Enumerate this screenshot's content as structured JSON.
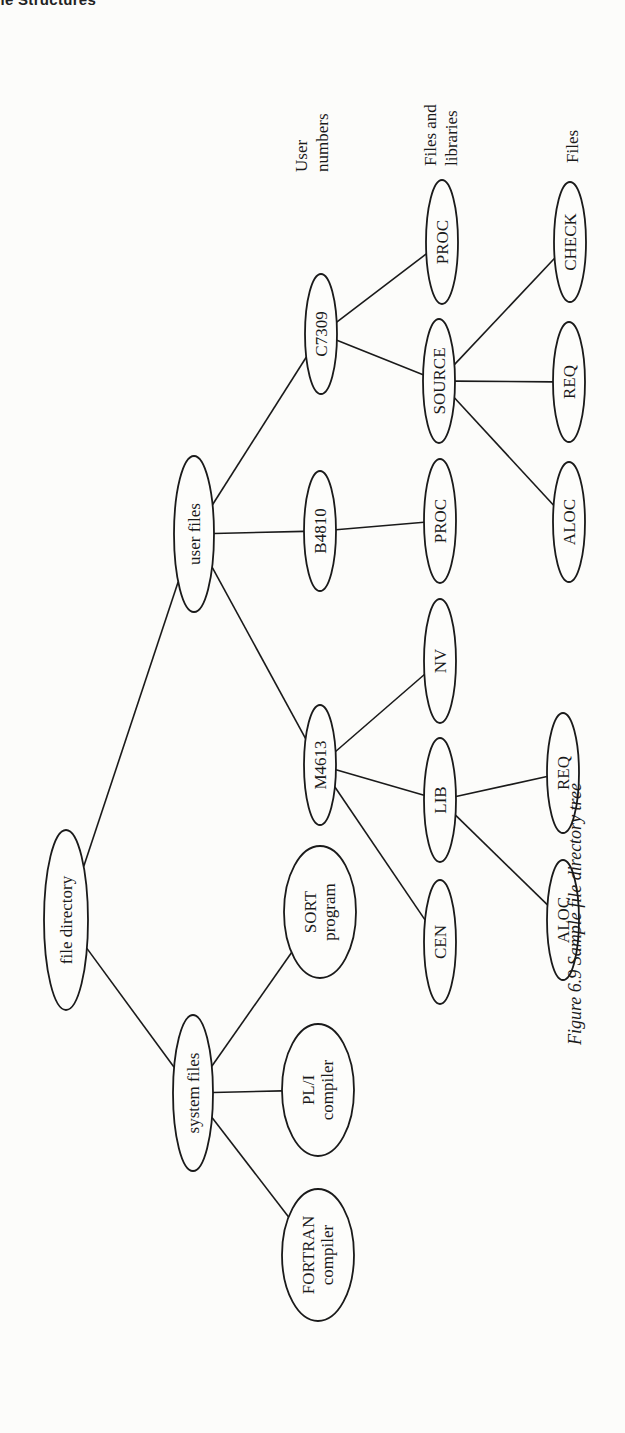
{
  "page": {
    "running_head": "ile Structures"
  },
  "diagram": {
    "orientation": "rotated 90deg counter-clockwise",
    "caption": "Figure 6.9 Sample file directory tree",
    "level_labels": [
      {
        "id": "user-numbers",
        "lines": [
          "User",
          "numbers"
        ]
      },
      {
        "id": "files-and-libraries",
        "lines": [
          "Files and",
          "libraries"
        ]
      },
      {
        "id": "files",
        "lines": [
          "Files"
        ]
      }
    ],
    "nodes": [
      {
        "id": "file-directory",
        "lines": [
          "file directory"
        ]
      },
      {
        "id": "system-files",
        "lines": [
          "system files"
        ]
      },
      {
        "id": "user-files",
        "lines": [
          "user files"
        ]
      },
      {
        "id": "fortran-compiler",
        "lines": [
          "FORTRAN",
          "compiler"
        ]
      },
      {
        "id": "pli-compiler",
        "lines": [
          "PL/I",
          "compiler"
        ]
      },
      {
        "id": "sort-program",
        "lines": [
          "SORT",
          "program"
        ]
      },
      {
        "id": "m4613",
        "lines": [
          "M4613"
        ]
      },
      {
        "id": "b4810",
        "lines": [
          "B4810"
        ]
      },
      {
        "id": "c7309",
        "lines": [
          "C7309"
        ]
      },
      {
        "id": "cen",
        "lines": [
          "CEN"
        ]
      },
      {
        "id": "lib",
        "lines": [
          "LIB"
        ]
      },
      {
        "id": "nv",
        "lines": [
          "NV"
        ]
      },
      {
        "id": "b4810-proc",
        "lines": [
          "PROC"
        ]
      },
      {
        "id": "source",
        "lines": [
          "SOURCE"
        ]
      },
      {
        "id": "c7309-proc",
        "lines": [
          "PROC"
        ]
      },
      {
        "id": "lib-aloc",
        "lines": [
          "ALOC"
        ]
      },
      {
        "id": "lib-req",
        "lines": [
          "REQ"
        ]
      },
      {
        "id": "source-aloc",
        "lines": [
          "ALOC"
        ]
      },
      {
        "id": "source-req",
        "lines": [
          "REQ"
        ]
      },
      {
        "id": "check",
        "lines": [
          "CHECK"
        ]
      }
    ],
    "edges": [
      [
        "file-directory",
        "system-files"
      ],
      [
        "file-directory",
        "user-files"
      ],
      [
        "system-files",
        "fortran-compiler"
      ],
      [
        "system-files",
        "pli-compiler"
      ],
      [
        "system-files",
        "sort-program"
      ],
      [
        "user-files",
        "m4613"
      ],
      [
        "user-files",
        "b4810"
      ],
      [
        "user-files",
        "c7309"
      ],
      [
        "m4613",
        "cen"
      ],
      [
        "m4613",
        "lib"
      ],
      [
        "m4613",
        "nv"
      ],
      [
        "b4810",
        "b4810-proc"
      ],
      [
        "c7309",
        "source"
      ],
      [
        "c7309",
        "c7309-proc"
      ],
      [
        "lib",
        "lib-aloc"
      ],
      [
        "lib",
        "lib-req"
      ],
      [
        "source",
        "source-aloc"
      ],
      [
        "source",
        "source-req"
      ],
      [
        "source",
        "check"
      ]
    ]
  }
}
